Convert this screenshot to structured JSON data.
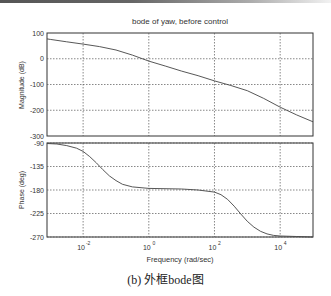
{
  "figure": {
    "caption": "(b) 外框bode图"
  },
  "chart_data": [
    {
      "type": "line",
      "title": "bode of yaw, before control",
      "xlabel": "",
      "ylabel": "Magnitude (dB)",
      "xscale": "log",
      "xlim_log10": [
        -3.1,
        5.0
      ],
      "ylim": [
        -300,
        100
      ],
      "yticks": [
        100,
        0,
        -100,
        -200,
        -300
      ],
      "grid": true,
      "series": [
        {
          "name": "Magnitude",
          "x_log10": [
            -3.1,
            -3,
            -2.5,
            -2,
            -1.5,
            -1,
            -0.5,
            0,
            0.5,
            1,
            1.5,
            2,
            2.5,
            3,
            3.5,
            4,
            4.5,
            5
          ],
          "values": [
            77,
            75,
            66,
            57,
            47,
            34,
            14,
            -9,
            -28,
            -48,
            -66,
            -86,
            -104,
            -124,
            -154,
            -188,
            -218,
            -245
          ]
        }
      ]
    },
    {
      "type": "line",
      "title": "",
      "xlabel": "Frequency (rad/sec)",
      "ylabel": "Phase (deg)",
      "xscale": "log",
      "xlim_log10": [
        -3.1,
        5.0
      ],
      "xticks": [
        "10^-2",
        "10^0",
        "10^2",
        "10^4"
      ],
      "ylim": [
        -270,
        -90
      ],
      "yticks": [
        -90,
        -135,
        -180,
        -225,
        -270
      ],
      "grid": true,
      "series": [
        {
          "name": "Phase",
          "x_log10": [
            -3.1,
            -2.8,
            -2.5,
            -2.2,
            -2,
            -1.8,
            -1.6,
            -1.4,
            -1.2,
            -1,
            -0.8,
            -0.5,
            0,
            1,
            1.5,
            2,
            2.2,
            2.4,
            2.6,
            2.8,
            3,
            3.2,
            3.4,
            3.6,
            3.8,
            4,
            4.5,
            5
          ],
          "values": [
            -91,
            -92,
            -95,
            -100,
            -106,
            -116,
            -128,
            -141,
            -153,
            -162,
            -169,
            -174,
            -177,
            -178,
            -180,
            -184,
            -189,
            -198,
            -211,
            -226,
            -240,
            -251,
            -259,
            -264,
            -267,
            -268,
            -269,
            -270
          ]
        }
      ]
    }
  ],
  "axis_labels": {
    "title": "bode of yaw, before control",
    "mag_ylabel": "Magnitude (dB)",
    "phase_ylabel": "Phase (deg)",
    "xlabel": "Frequency (rad/sec)",
    "mag_ticks": [
      "100",
      "0",
      "-100",
      "-200",
      "-300"
    ],
    "phase_ticks": [
      "-90",
      "-135",
      "-180",
      "-225",
      "-270"
    ],
    "x_ticks": [
      {
        "base": "10",
        "exp": "-2"
      },
      {
        "base": "10",
        "exp": "0"
      },
      {
        "base": "10",
        "exp": "2"
      },
      {
        "base": "10",
        "exp": "4"
      }
    ]
  },
  "colors": {
    "line": "#444444",
    "axes": "#333333",
    "grid": "#555555"
  }
}
